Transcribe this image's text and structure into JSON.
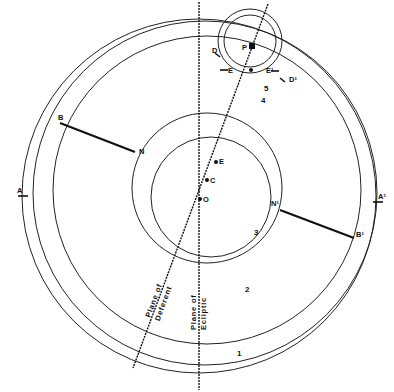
{
  "diagram": {
    "title": "",
    "points": {
      "A": "A",
      "A_prime": "A¹",
      "B": "B",
      "B_prime": "B¹",
      "N": "N",
      "N_prime": "N¹",
      "E": "E",
      "C": "C",
      "O": "O",
      "P": "P",
      "D": "D",
      "D_prime": "D¹",
      "E_epi": "E",
      "E_epi_prime": "E¹"
    },
    "regions": [
      "1",
      "2",
      "3",
      "4",
      "5"
    ],
    "lines": {
      "ecliptic": {
        "line1": "Plane of",
        "line2": "Ecliptic"
      },
      "deferent": {
        "line1": "Plane of",
        "line2": "Deferent"
      }
    }
  }
}
